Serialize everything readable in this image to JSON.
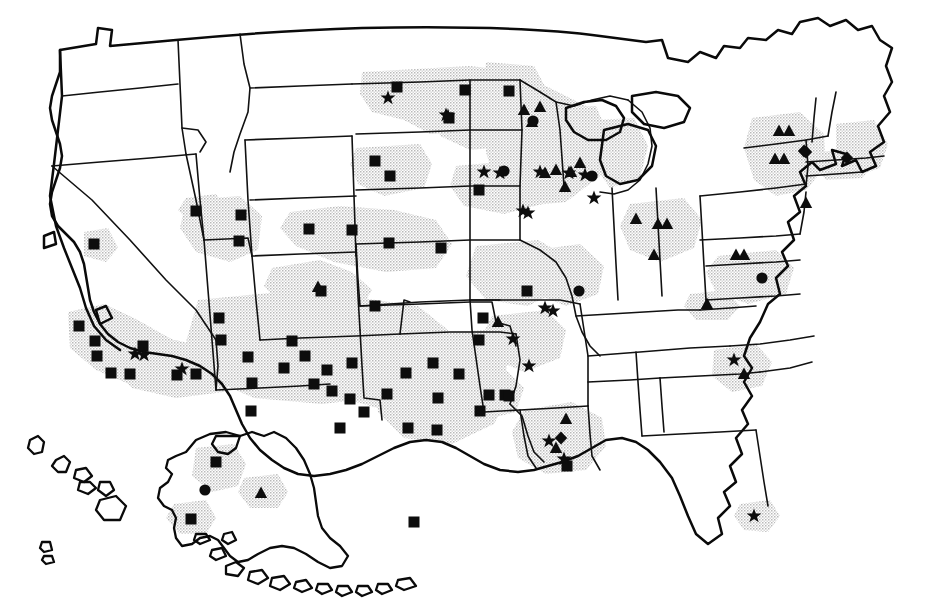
{
  "figure": {
    "type": "thematic-point-map",
    "region": "United States",
    "background_color": "#ffffff",
    "line_color": "#0d0d0d",
    "shading_color": "#c9c9c9",
    "marker_color": "#0d0d0d",
    "marker_shapes": [
      "square",
      "star",
      "triangle",
      "circle",
      "diamond"
    ],
    "includes_insets": [
      "Alaska",
      "Hawaii"
    ],
    "has_labels": false,
    "has_legend": false,
    "has_title": false,
    "has_axes": false
  },
  "chart_data": {
    "type": "scatter",
    "title": "",
    "subtitle": "",
    "xlabel": "",
    "ylabel": "",
    "grid": false,
    "legend_position": "none",
    "projection": "us-albers-like",
    "xlim": [
      0,
      925
    ],
    "ylim": [
      0,
      608
    ],
    "marker_counts": {
      "square": 58,
      "star": 22,
      "triangle": 26,
      "circle": 6,
      "diamond": 4,
      "total": 116
    },
    "series": [
      {
        "name": "square",
        "shape": "square",
        "color": "#0d0d0d",
        "count": 58,
        "points": [
          {
            "x": 397,
            "y": 87
          },
          {
            "x": 465,
            "y": 90
          },
          {
            "x": 449,
            "y": 118
          },
          {
            "x": 509,
            "y": 91
          },
          {
            "x": 375,
            "y": 161
          },
          {
            "x": 390,
            "y": 176
          },
          {
            "x": 479,
            "y": 190
          },
          {
            "x": 94,
            "y": 244
          },
          {
            "x": 196,
            "y": 211
          },
          {
            "x": 241,
            "y": 215
          },
          {
            "x": 239,
            "y": 241
          },
          {
            "x": 309,
            "y": 229
          },
          {
            "x": 352,
            "y": 230
          },
          {
            "x": 389,
            "y": 243
          },
          {
            "x": 441,
            "y": 248
          },
          {
            "x": 321,
            "y": 291
          },
          {
            "x": 375,
            "y": 306
          },
          {
            "x": 527,
            "y": 291
          },
          {
            "x": 79,
            "y": 326
          },
          {
            "x": 95,
            "y": 341
          },
          {
            "x": 97,
            "y": 356
          },
          {
            "x": 111,
            "y": 373
          },
          {
            "x": 130,
            "y": 374
          },
          {
            "x": 143,
            "y": 346
          },
          {
            "x": 177,
            "y": 375
          },
          {
            "x": 196,
            "y": 374
          },
          {
            "x": 219,
            "y": 318
          },
          {
            "x": 221,
            "y": 340
          },
          {
            "x": 248,
            "y": 357
          },
          {
            "x": 252,
            "y": 383
          },
          {
            "x": 251,
            "y": 411
          },
          {
            "x": 284,
            "y": 368
          },
          {
            "x": 305,
            "y": 356
          },
          {
            "x": 314,
            "y": 384
          },
          {
            "x": 327,
            "y": 370
          },
          {
            "x": 332,
            "y": 391
          },
          {
            "x": 350,
            "y": 399
          },
          {
            "x": 352,
            "y": 363
          },
          {
            "x": 387,
            "y": 394
          },
          {
            "x": 406,
            "y": 373
          },
          {
            "x": 433,
            "y": 363
          },
          {
            "x": 438,
            "y": 398
          },
          {
            "x": 437,
            "y": 430
          },
          {
            "x": 459,
            "y": 374
          },
          {
            "x": 489,
            "y": 395
          },
          {
            "x": 480,
            "y": 411
          },
          {
            "x": 505,
            "y": 395
          },
          {
            "x": 509,
            "y": 396
          },
          {
            "x": 567,
            "y": 466
          },
          {
            "x": 216,
            "y": 462
          },
          {
            "x": 191,
            "y": 519
          },
          {
            "x": 414,
            "y": 522
          },
          {
            "x": 483,
            "y": 318
          },
          {
            "x": 479,
            "y": 340
          },
          {
            "x": 340,
            "y": 428
          },
          {
            "x": 292,
            "y": 341
          },
          {
            "x": 364,
            "y": 412
          },
          {
            "x": 408,
            "y": 428
          }
        ]
      },
      {
        "name": "star",
        "shape": "star",
        "color": "#0d0d0d",
        "count": 22,
        "points": [
          {
            "x": 388,
            "y": 98
          },
          {
            "x": 446,
            "y": 115
          },
          {
            "x": 484,
            "y": 172
          },
          {
            "x": 523,
            "y": 211
          },
          {
            "x": 594,
            "y": 198
          },
          {
            "x": 540,
            "y": 172
          },
          {
            "x": 144,
            "y": 355
          },
          {
            "x": 182,
            "y": 369
          },
          {
            "x": 545,
            "y": 308
          },
          {
            "x": 513,
            "y": 339
          },
          {
            "x": 529,
            "y": 366
          },
          {
            "x": 549,
            "y": 441
          },
          {
            "x": 564,
            "y": 459
          },
          {
            "x": 734,
            "y": 360
          },
          {
            "x": 754,
            "y": 516
          },
          {
            "x": 553,
            "y": 311
          },
          {
            "x": 585,
            "y": 175
          },
          {
            "x": 569,
            "y": 173
          },
          {
            "x": 448,
            "y": 116
          },
          {
            "x": 135,
            "y": 354
          },
          {
            "x": 500,
            "y": 173
          },
          {
            "x": 528,
            "y": 213
          }
        ]
      },
      {
        "name": "triangle",
        "shape": "triangle",
        "color": "#0d0d0d",
        "count": 26,
        "points": [
          {
            "x": 524,
            "y": 110
          },
          {
            "x": 540,
            "y": 107
          },
          {
            "x": 532,
            "y": 122
          },
          {
            "x": 545,
            "y": 173
          },
          {
            "x": 556,
            "y": 170
          },
          {
            "x": 571,
            "y": 172
          },
          {
            "x": 580,
            "y": 163
          },
          {
            "x": 565,
            "y": 187
          },
          {
            "x": 658,
            "y": 224
          },
          {
            "x": 667,
            "y": 224
          },
          {
            "x": 654,
            "y": 255
          },
          {
            "x": 707,
            "y": 304
          },
          {
            "x": 736,
            "y": 255
          },
          {
            "x": 744,
            "y": 255
          },
          {
            "x": 779,
            "y": 131
          },
          {
            "x": 789,
            "y": 131
          },
          {
            "x": 775,
            "y": 159
          },
          {
            "x": 784,
            "y": 159
          },
          {
            "x": 806,
            "y": 203
          },
          {
            "x": 318,
            "y": 287
          },
          {
            "x": 498,
            "y": 322
          },
          {
            "x": 566,
            "y": 419
          },
          {
            "x": 556,
            "y": 448
          },
          {
            "x": 744,
            "y": 374
          },
          {
            "x": 261,
            "y": 493
          },
          {
            "x": 636,
            "y": 219
          }
        ]
      },
      {
        "name": "circle",
        "shape": "circle",
        "color": "#0d0d0d",
        "count": 6,
        "points": [
          {
            "x": 592,
            "y": 176
          },
          {
            "x": 504,
            "y": 171
          },
          {
            "x": 579,
            "y": 291
          },
          {
            "x": 762,
            "y": 278
          },
          {
            "x": 205,
            "y": 490
          },
          {
            "x": 533,
            "y": 121
          }
        ]
      },
      {
        "name": "diamond",
        "shape": "diamond",
        "color": "#0d0d0d",
        "count": 4,
        "points": [
          {
            "x": 804,
            "y": 151
          },
          {
            "x": 847,
            "y": 158
          },
          {
            "x": 561,
            "y": 438
          },
          {
            "x": 806,
            "y": 152
          }
        ]
      }
    ]
  },
  "shading_regions": [
    {
      "name": "northern-plains-band"
    },
    {
      "name": "upper-midwest-band"
    },
    {
      "name": "great-lakes-band"
    },
    {
      "name": "central-plains-band"
    },
    {
      "name": "southwest-band"
    },
    {
      "name": "california-coast-band"
    },
    {
      "name": "gulf-coast-band"
    },
    {
      "name": "northeast-band"
    },
    {
      "name": "southeast-band"
    },
    {
      "name": "florida-tip-band"
    },
    {
      "name": "alaska-band"
    }
  ]
}
